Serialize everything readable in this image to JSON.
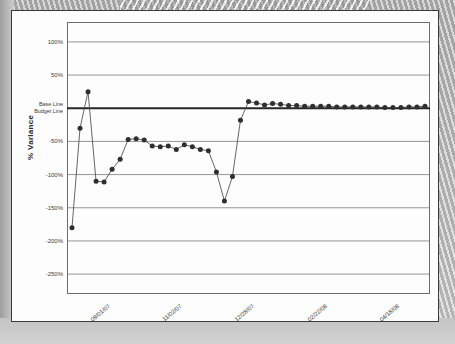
{
  "document": {
    "type": "scanned-chart-page"
  },
  "chart_data": {
    "type": "line",
    "title": "",
    "xlabel": "",
    "ylabel": "% Variance",
    "ylim": [
      -280,
      130
    ],
    "yticks": [
      100,
      50,
      0,
      -50,
      -100,
      -150,
      -200,
      -250
    ],
    "ytick_labels": [
      "100%",
      "50%",
      "",
      "-50%",
      "-100%",
      "-150%",
      "-200%",
      "-250%"
    ],
    "grid": true,
    "legend": "none",
    "baseline_value": 0,
    "baseline_labels": [
      "Base Line",
      "Budget Line"
    ],
    "marker": "filled-circle",
    "marker_color": "#2f2f2f",
    "line_color": "#4a4a4a",
    "xtick_labels": [
      "09/01/07",
      "11/02/07",
      "12/28/07",
      "02/22/08",
      "04/18/08"
    ],
    "xtick_positions": [
      0,
      9,
      18,
      27,
      36
    ],
    "n_points": 45,
    "x": [
      0,
      1,
      2,
      3,
      4,
      5,
      6,
      7,
      8,
      9,
      10,
      11,
      12,
      13,
      14,
      15,
      16,
      17,
      18,
      19,
      20,
      21,
      22,
      23,
      24,
      25,
      26,
      27,
      28,
      29,
      30,
      31,
      32,
      33,
      34,
      35,
      36,
      37,
      38,
      39,
      40,
      41,
      42,
      43,
      44
    ],
    "values": [
      -180,
      -30,
      25,
      -110,
      -111,
      -92,
      -77,
      -47,
      -46,
      -48,
      -57,
      -58,
      -57,
      -62,
      -55,
      -58,
      -62,
      -64,
      -96,
      -140,
      -103,
      -18,
      10,
      8,
      5,
      7,
      6,
      4,
      4,
      3,
      3,
      3,
      3,
      2,
      2,
      2,
      2,
      2,
      2,
      1,
      1,
      1,
      2,
      2,
      3
    ],
    "annotations": [
      {
        "text": "Base Line",
        "y": 0
      },
      {
        "text": "Budget Line",
        "y": 0
      }
    ]
  },
  "axis": {
    "y_title": "% Variance",
    "y_ticks": [
      {
        "label": "100%",
        "value": 100
      },
      {
        "label": "50%",
        "value": 50
      },
      {
        "label": "Base Line",
        "value": 0
      },
      {
        "label": "Budget Line",
        "value": 0
      },
      {
        "label": "-50%",
        "value": -50
      },
      {
        "label": "-100%",
        "value": -100
      },
      {
        "label": "-150%",
        "value": -150
      },
      {
        "label": "-200%",
        "value": -200
      },
      {
        "label": "-250%",
        "value": -250
      }
    ],
    "x_ticks": [
      {
        "label": "09/01/07",
        "index": 0
      },
      {
        "label": "11/02/07",
        "index": 9
      },
      {
        "label": "12/28/07",
        "index": 18
      },
      {
        "label": "02/22/08",
        "index": 27
      },
      {
        "label": "04/18/08",
        "index": 36
      }
    ]
  },
  "colors": {
    "page": "#fdfdfd",
    "border": "#3a3a3a",
    "grid": "#8a8a8a",
    "baseline": "#262626",
    "marker": "#2f2f2f",
    "line": "#4a4a4a",
    "text": "#3b3b3b"
  }
}
